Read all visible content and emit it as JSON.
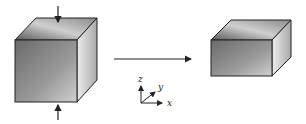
{
  "diagram": {
    "initial_shape": "cube",
    "final_shape": "flattened rectangular box",
    "transform_arrow": "right-arrow",
    "forces": [
      "compression-arrow-top",
      "compression-arrow-bottom"
    ],
    "axes": {
      "x_label": "x",
      "y_label": "y",
      "z_label": "z"
    }
  }
}
